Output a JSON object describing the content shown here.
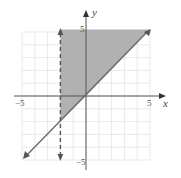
{
  "chart_data": {
    "type": "inequality-graph",
    "title": "",
    "xlabel": "x",
    "ylabel": "y",
    "xlim": [
      -5,
      5
    ],
    "ylim": [
      -5,
      5
    ],
    "grid": true,
    "tick_labels": {
      "x": [
        "-5",
        "5"
      ],
      "y": [
        "5",
        "-5"
      ]
    },
    "boundaries": [
      {
        "equation": "y = x",
        "style": "solid",
        "arrows": "both"
      },
      {
        "equation": "x = -2",
        "style": "dashed",
        "arrows": "both"
      }
    ],
    "shaded_region": "y >= x and x > -2",
    "colors": {
      "shade": "#a9a9a9",
      "line": "#6b6b6b",
      "grid": "#e3e3e3",
      "axis": "#555555"
    }
  },
  "labels": {
    "x_axis": "x",
    "y_axis": "y",
    "x_min": "−5",
    "x_max": "5",
    "y_max": "5",
    "y_min": "−5"
  }
}
